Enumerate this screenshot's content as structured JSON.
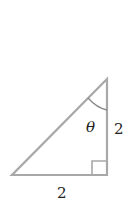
{
  "diagram": {
    "type": "right-triangle",
    "angle_label": "θ",
    "vertical_side_label": "2",
    "horizontal_side_label": "2",
    "colors": {
      "stroke": "#a8a8a8",
      "text": "#222222",
      "background": "#ffffff"
    }
  }
}
